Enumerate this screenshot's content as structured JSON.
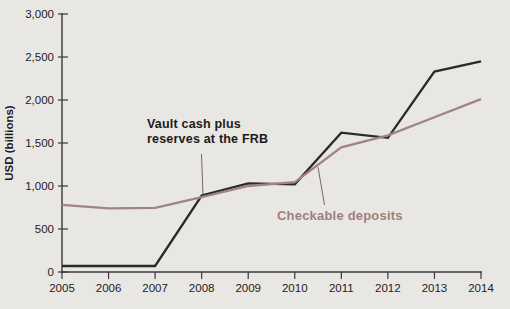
{
  "figure": {
    "width": 510,
    "height": 309
  },
  "colors": {
    "background": "#e9e7e4",
    "axis": "#3a3a3a",
    "tick_label": "#1c1c1c",
    "leader_line": "#5f5a58"
  },
  "annotations": {
    "vault": {
      "line1": "Vault cash plus",
      "line2": "reserves at the FRB",
      "color": "#1b1b1b"
    },
    "checkable": {
      "text": "Checkable deposits",
      "color": "#9f7f7c"
    }
  },
  "chart_data": {
    "type": "line",
    "title": "",
    "xlabel": "",
    "ylabel": "USD (billions)",
    "x": [
      2005,
      2006,
      2007,
      2008,
      2009,
      2010,
      2011,
      2012,
      2013,
      2014
    ],
    "xtick_labels": [
      "2005",
      "2006",
      "2007",
      "2008",
      "2009",
      "2010",
      "2011",
      "2012",
      "2013",
      "2014"
    ],
    "yticks": [
      0,
      500,
      1000,
      1500,
      2000,
      2500,
      3000
    ],
    "ytick_labels": [
      "0",
      "500",
      "1,000",
      "1,500",
      "2,000",
      "2,500",
      "3,000"
    ],
    "ylim": [
      0,
      3000
    ],
    "grid": false,
    "legend": "none (labels annotated inline on chart)",
    "series": [
      {
        "name": "Vault cash plus reserves at the FRB",
        "color": "#2a2a2a",
        "values": [
          70,
          70,
          70,
          890,
          1030,
          1020,
          1620,
          1560,
          2330,
          2450
        ]
      },
      {
        "name": "Checkable deposits",
        "color": "#a18381",
        "values": [
          780,
          740,
          745,
          870,
          1000,
          1045,
          1450,
          1590,
          1800,
          2010
        ]
      }
    ]
  }
}
